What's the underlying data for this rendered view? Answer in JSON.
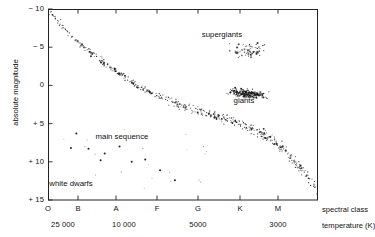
{
  "figure": {
    "type": "hertzsprung-russell-diagram",
    "background": "#ffffff",
    "ink": "#111111"
  },
  "axes": {
    "y": {
      "label": "absolute magnitude",
      "ticks": [
        {
          "text": "− 10",
          "value": -10
        },
        {
          "text": "− 5",
          "value": -5
        },
        {
          "text": "0",
          "value": 0
        },
        {
          "text": "+ 5",
          "value": 5
        },
        {
          "text": "+ 10",
          "value": 10
        },
        {
          "text": "+ 15",
          "value": 15
        }
      ],
      "range": [
        -10,
        15
      ],
      "direction": "inverted"
    },
    "x_spectral": {
      "label": "spectral class",
      "ticks": [
        {
          "text": "O",
          "px": 48
        },
        {
          "text": "B",
          "px": 78
        },
        {
          "text": "A",
          "px": 116
        },
        {
          "text": "F",
          "px": 157
        },
        {
          "text": "G",
          "px": 198
        },
        {
          "text": "K",
          "px": 240
        },
        {
          "text": "M",
          "px": 278
        }
      ]
    },
    "x_temperature": {
      "label": "temperature (K)",
      "ticks": [
        {
          "text": "25 000",
          "px": 63
        },
        {
          "text": "10 000",
          "px": 124
        },
        {
          "text": "5000",
          "px": 198
        },
        {
          "text": "3000",
          "px": 278
        }
      ]
    }
  },
  "annotations": [
    {
      "text": "supergiants",
      "x": 222,
      "y": 34
    },
    {
      "text": "giants",
      "x": 244,
      "y": 100
    },
    {
      "text": "main sequence",
      "x": 122,
      "y": 136
    },
    {
      "text": "white dwarfs",
      "x": 71,
      "y": 183
    }
  ],
  "chart_data": {
    "type": "scatter",
    "title": "",
    "xlabel": "spectral class",
    "ylabel": "absolute magnitude",
    "xlim": [
      0,
      1
    ],
    "ylim": [
      -10,
      15
    ],
    "y_inverted": true,
    "grid": false,
    "legend": "none",
    "axis_note": "x axis is spectral class O B A F G K M; secondary axis is temperature in kelvin decreasing left to right",
    "populations": [
      {
        "name": "main sequence",
        "description": "dense diagonal band from hot luminous upper-left to cool faint lower-right",
        "point_count": 520,
        "dot_size_px": 1.1,
        "path": [
          {
            "x": 0.01,
            "y": -9.5
          },
          {
            "x": 0.1,
            "y": -6.0
          },
          {
            "x": 0.22,
            "y": -2.6
          },
          {
            "x": 0.34,
            "y": 0.2
          },
          {
            "x": 0.46,
            "y": 2.2
          },
          {
            "x": 0.58,
            "y": 3.6
          },
          {
            "x": 0.7,
            "y": 4.8
          },
          {
            "x": 0.8,
            "y": 6.4
          },
          {
            "x": 0.88,
            "y": 8.6
          },
          {
            "x": 0.95,
            "y": 11.5
          },
          {
            "x": 1.0,
            "y": 13.8
          }
        ],
        "spread": 1.15
      },
      {
        "name": "giants",
        "description": "dense clump of cool luminous stars around magnitude 0 to +3 near classes G to K",
        "point_count": 300,
        "dot_size_px": 1.1,
        "center": {
          "x": 0.74,
          "y": 1.1
        },
        "extent": {
          "x": 0.22,
          "y": 1.9
        }
      },
      {
        "name": "supergiants",
        "description": "sparse scatter of very luminous stars near magnitude -5",
        "point_count": 70,
        "dot_size_px": 1.2,
        "center": {
          "x": 0.74,
          "y": -4.6
        },
        "extent": {
          "x": 0.25,
          "y": 3.0
        }
      },
      {
        "name": "white dwarfs",
        "description": "small group of large dark dots, hot but faint, lower left of the diagram",
        "dot_size_px": 2.0,
        "points": [
          {
            "x": 0.105,
            "y": 6.3
          },
          {
            "x": 0.085,
            "y": 8.2
          },
          {
            "x": 0.15,
            "y": 8.3
          },
          {
            "x": 0.21,
            "y": 8.9
          },
          {
            "x": 0.265,
            "y": 8.0
          },
          {
            "x": 0.195,
            "y": 9.8
          },
          {
            "x": 0.31,
            "y": 10.0
          },
          {
            "x": 0.36,
            "y": 9.7
          },
          {
            "x": 0.415,
            "y": 11.1
          },
          {
            "x": 0.47,
            "y": 12.4
          }
        ]
      }
    ]
  }
}
